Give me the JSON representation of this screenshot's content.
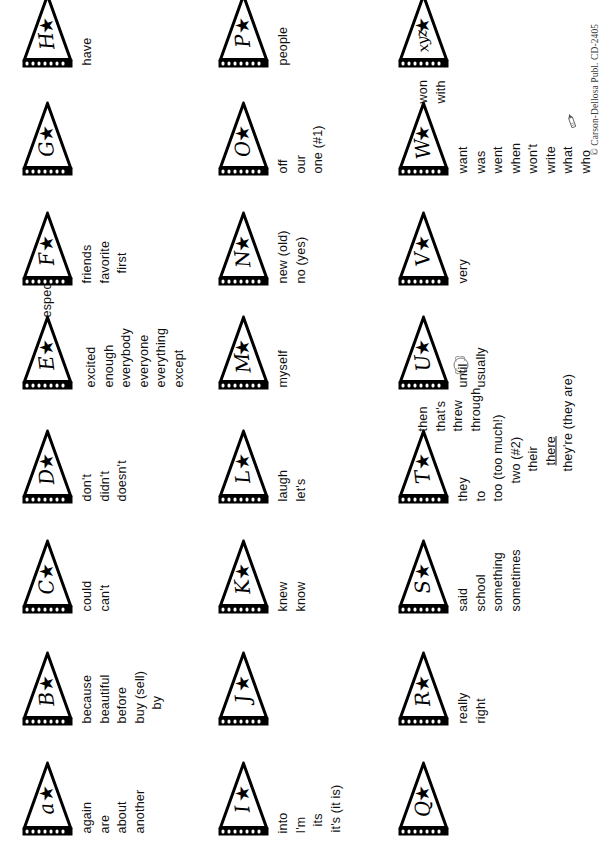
{
  "document": {
    "title": "Alphabet Pennant Sight-Word Chart",
    "copyright": "© Carson-Dellosa Publ. CD-2405",
    "orientation": "landscape-sheet-rotated-90ccw",
    "pennant_icon": "pennant-flag-with-star-icon",
    "star_glyph": "★",
    "ink_color": "#000000",
    "paper_color": "#ffffff"
  },
  "pennants": [
    {
      "id": "a",
      "letter": "a",
      "label": "pennant-a",
      "words": [
        "again",
        "are",
        "about",
        "another"
      ]
    },
    {
      "id": "b",
      "letter": "B",
      "label": "pennant-b",
      "words": [
        "because",
        "beautiful",
        "before",
        "buy (sell)",
        "by"
      ]
    },
    {
      "id": "c",
      "letter": "C",
      "label": "pennant-c",
      "words": [
        "could",
        "can't"
      ]
    },
    {
      "id": "d",
      "letter": "D",
      "label": "pennant-d",
      "words": [
        "don't",
        "didn't",
        "doesn't"
      ]
    },
    {
      "id": "e",
      "letter": "E",
      "label": "pennant-e",
      "words": [
        "excited",
        "enough",
        "everybody",
        "everyone",
        "everything",
        "except"
      ],
      "extra_word": "especially"
    },
    {
      "id": "f",
      "letter": "F",
      "label": "pennant-f",
      "words": [
        "friends",
        "favorite",
        "first"
      ]
    },
    {
      "id": "g",
      "letter": "G",
      "label": "pennant-g",
      "words": []
    },
    {
      "id": "h",
      "letter": "H",
      "label": "pennant-h",
      "words": [
        "have"
      ]
    },
    {
      "id": "i",
      "letter": "I",
      "label": "pennant-i",
      "words": [
        "into",
        "I'm",
        "its",
        "it's (it is)"
      ]
    },
    {
      "id": "j",
      "letter": "J",
      "label": "pennant-j",
      "words": []
    },
    {
      "id": "k",
      "letter": "K",
      "label": "pennant-k",
      "words": [
        "knew",
        "know"
      ]
    },
    {
      "id": "l",
      "letter": "L",
      "label": "pennant-l",
      "words": [
        "laugh",
        "let's"
      ]
    },
    {
      "id": "m",
      "letter": "M",
      "label": "pennant-m",
      "words": [
        "myself"
      ]
    },
    {
      "id": "n",
      "letter": "N",
      "label": "pennant-n",
      "words": [
        "new (old)",
        "no (yes)"
      ]
    },
    {
      "id": "o",
      "letter": "O",
      "label": "pennant-o",
      "words": [
        "off",
        "our",
        "one (#1)"
      ]
    },
    {
      "id": "p",
      "letter": "P",
      "label": "pennant-p",
      "words": [
        "people"
      ]
    },
    {
      "id": "q",
      "letter": "Q",
      "label": "pennant-q",
      "words": []
    },
    {
      "id": "r",
      "letter": "R",
      "label": "pennant-r",
      "words": [
        "really",
        "right"
      ]
    },
    {
      "id": "s",
      "letter": "S",
      "label": "pennant-s",
      "words": [
        "said",
        "school",
        "something",
        "sometimes"
      ]
    },
    {
      "id": "t",
      "letter": "T",
      "label": "pennant-t",
      "words": [
        "they",
        "to",
        "too (too much!)",
        "two (#2)",
        "their",
        "there",
        "they're (they are)"
      ],
      "extra_words": [
        "then",
        "that's",
        "threw",
        "through"
      ],
      "underlined_word": "there",
      "icon": "baseball-icon"
    },
    {
      "id": "u",
      "letter": "U",
      "label": "pennant-u",
      "words": [
        "until",
        "usually"
      ]
    },
    {
      "id": "v",
      "letter": "V",
      "label": "pennant-v",
      "words": [
        "very"
      ]
    },
    {
      "id": "w",
      "letter": "W",
      "label": "pennant-w",
      "words": [
        "want",
        "was",
        "went",
        "when",
        "won't",
        "write",
        "what",
        "who"
      ],
      "extra_words": [
        "won",
        "with"
      ],
      "icon": "pencil-icon"
    },
    {
      "id": "xyz",
      "letter": "xyz",
      "label": "pennant-xyz",
      "words": []
    }
  ],
  "rows": {
    "row1": {
      "name": "row-a-through-h"
    },
    "row2": {
      "name": "row-i-through-p"
    },
    "row3": {
      "name": "row-q-through-xyz"
    }
  }
}
